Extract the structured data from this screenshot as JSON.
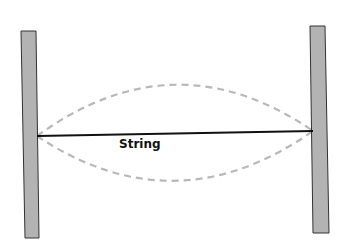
{
  "diagram": {
    "type": "standing-wave-string",
    "labels": {
      "string": "String"
    },
    "colors": {
      "background": "#ffffff",
      "post_fill": "#b3b3b3",
      "post_stroke": "#333333",
      "string": "#111111",
      "vibration_dash": "#b8b8b8"
    },
    "elements": {
      "left_post": {
        "corners": [
          [
            21,
            31
          ],
          [
            36,
            31
          ],
          [
            39,
            238
          ],
          [
            25,
            238
          ]
        ]
      },
      "right_post": {
        "corners": [
          [
            310,
            26
          ],
          [
            325,
            26
          ],
          [
            329,
            233
          ],
          [
            313,
            233
          ]
        ]
      },
      "string": {
        "from": [
          37,
          136
        ],
        "to": [
          313,
          131
        ]
      },
      "vibration_envelope": {
        "upper_peak_y": 86,
        "lower_trough_y": 181,
        "style": "dashed"
      }
    }
  }
}
